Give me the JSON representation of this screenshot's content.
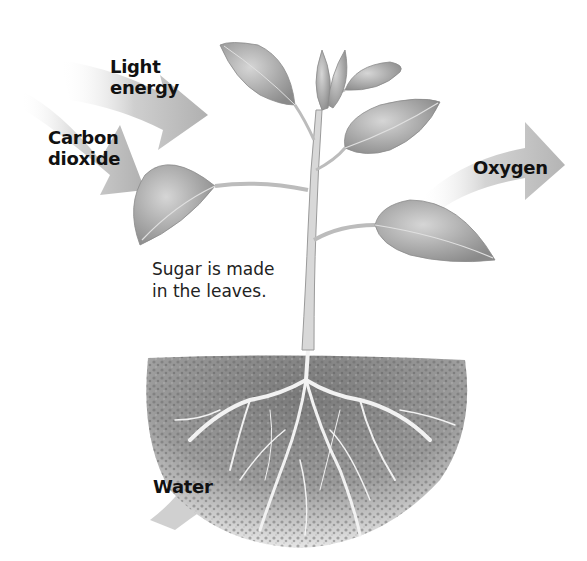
{
  "diagram": {
    "colors": {
      "background": "#ffffff",
      "arrow": "#b8b8b8",
      "leaf": "#9a9a9a",
      "stem": "#d8d8d8",
      "soil": "#8a8a8a",
      "text": "#111111"
    },
    "inputs": [
      {
        "id": "light",
        "line1": "Light",
        "line2": "energy",
        "direction": "into leaves"
      },
      {
        "id": "co2",
        "line1": "Carbon",
        "line2": "dioxide",
        "direction": "into leaves"
      },
      {
        "id": "water",
        "line1": "Water",
        "direction": "into roots"
      }
    ],
    "outputs": [
      {
        "id": "oxygen",
        "line1": "Oxygen",
        "direction": "out of leaves"
      }
    ],
    "caption": {
      "line1": "Sugar is made",
      "line2": "in the leaves."
    },
    "parts": [
      "leaves",
      "stem",
      "roots",
      "soil"
    ]
  }
}
